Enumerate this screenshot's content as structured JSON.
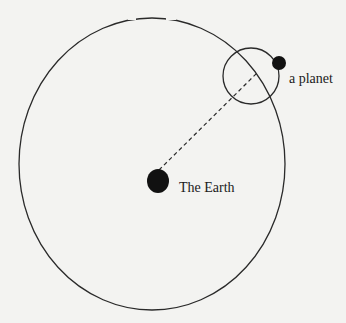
{
  "diagram": {
    "labels": {
      "planet": "a planet",
      "earth": "The Earth"
    },
    "colors": {
      "background": "#f3f3f1",
      "stroke": "#2a2a2a",
      "fill": "#111111"
    }
  }
}
